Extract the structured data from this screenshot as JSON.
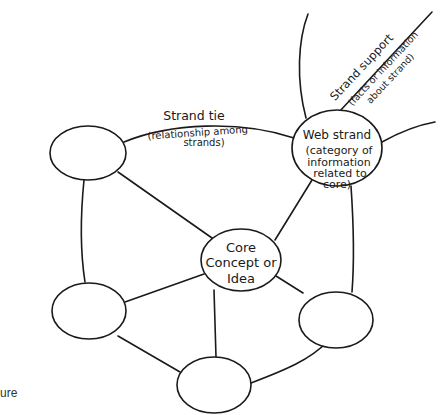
{
  "diagram": {
    "type": "semantic-web",
    "core": {
      "lines": [
        "Core",
        "Concept or",
        "Idea"
      ]
    },
    "web_strand": {
      "lines": [
        "Web strand",
        "(category of",
        "information",
        "related to",
        "core)"
      ]
    },
    "strand_tie": {
      "title": "Strand tie",
      "subtitle_lines": [
        "(relationship among",
        "strands)"
      ]
    },
    "strand_support": {
      "title": "Strand support",
      "subtitle_lines": [
        "(facts or information",
        "about strand)"
      ]
    },
    "caption_fragment": "ure"
  },
  "colors": {
    "stroke": "#1a1a1a",
    "background": "#ffffff"
  }
}
